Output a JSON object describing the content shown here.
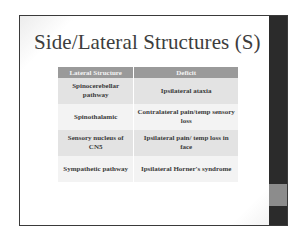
{
  "slide": {
    "title": "Side/Lateral Structures (S)",
    "colors": {
      "side_bar": "#2b2b2b",
      "side_bar_accent": "#8c8c8c",
      "table_header": "#9a9a9a",
      "row_shaded": "#e3e3e3",
      "row_plain": "#f3f3f3"
    },
    "table": {
      "headers": [
        "Lateral Structure",
        "Deficit"
      ],
      "rows": [
        {
          "structure": "Spinocerebellar pathway",
          "deficit": "Ipsilateral ataxia"
        },
        {
          "structure": "Spinothalamic",
          "deficit": "Contralateral pain/temp sensory loss"
        },
        {
          "structure": "Sensory nucleus of CN5",
          "deficit": "Ipsilateral pain/ temp loss in face"
        },
        {
          "structure": "Sympathetic pathway",
          "deficit": "Ipsilateral Horner's syndrome"
        }
      ]
    }
  }
}
